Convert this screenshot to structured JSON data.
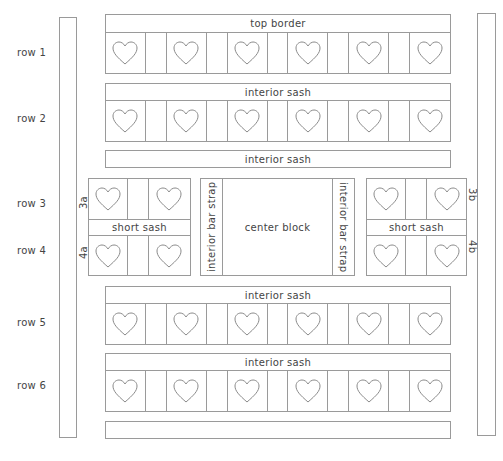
{
  "diagram": {
    "row_labels": [
      "row 1",
      "row 2",
      "row 3",
      "row 4",
      "row 5",
      "row 6"
    ],
    "strips": {
      "top_border": "top border",
      "sash_1": "interior sash",
      "sash_2": "interior sash",
      "sash_3": "interior sash",
      "sash_4": "interior sash",
      "bottom_border": ""
    },
    "middle": {
      "left_block": {
        "top_label": "3a",
        "bottom_label": "4a",
        "sash": "short sash"
      },
      "right_block": {
        "top_label": "3b",
        "bottom_label": "4b",
        "sash": "short sash"
      },
      "left_strap": "interior bar strap",
      "right_strap": "interior bar strap",
      "center": "center block"
    },
    "heart_rows": {
      "hearts_per_row": 6,
      "spacers_per_row": 5
    },
    "colors": {
      "line": "#9a9a9a",
      "text": "#444444",
      "heart": "#8a8a8a"
    }
  }
}
